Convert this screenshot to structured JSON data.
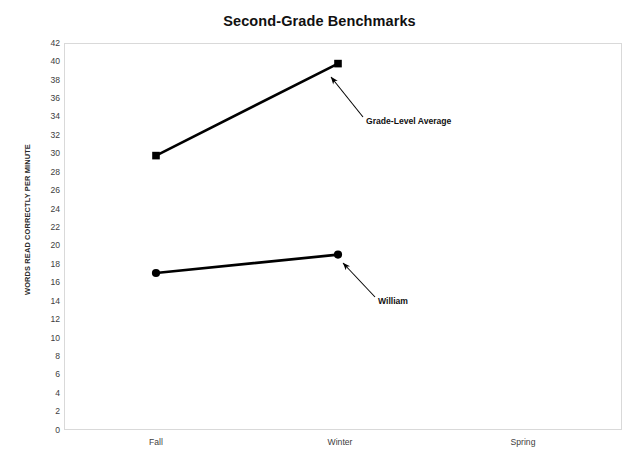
{
  "chart_data": {
    "type": "line",
    "title": "Second-Grade Benchmarks",
    "xlabel": "",
    "ylabel": "WORDS READ CORRECTLY PER MINUTE",
    "categories": [
      "Fall",
      "Winter",
      "Spring"
    ],
    "ylim": [
      0,
      42
    ],
    "ytick_step": 2,
    "yticks": [
      42,
      40,
      38,
      36,
      34,
      32,
      30,
      28,
      26,
      24,
      22,
      20,
      18,
      16,
      14,
      12,
      10,
      8,
      6,
      4,
      2,
      0
    ],
    "grid": false,
    "legend": "none",
    "series": [
      {
        "name": "Grade-Level Average",
        "marker": "square",
        "color": "#000000",
        "values": [
          30,
          40,
          null
        ]
      },
      {
        "name": "William",
        "marker": "circle",
        "color": "#000000",
        "values": [
          17,
          19,
          null
        ]
      }
    ],
    "annotations": [
      {
        "text": "Grade-Level Average",
        "points_to": "Grade-Level Average series at Winter (40)",
        "arrow": "up-left"
      },
      {
        "text": "William",
        "points_to": "William series at Winter (19)",
        "arrow": "up-left"
      }
    ]
  },
  "axis": {
    "y_title": "WORDS READ CORRECTLY PER MINUTE",
    "y_labels": [
      "42",
      "40",
      "38",
      "36",
      "34",
      "32",
      "30",
      "28",
      "26",
      "24",
      "22",
      "20",
      "18",
      "16",
      "14",
      "12",
      "10",
      "8",
      "6",
      "4",
      "2",
      "0"
    ],
    "x_labels": [
      "Fall",
      "Winter",
      "Spring"
    ]
  },
  "annotations": {
    "grade_level_average": "Grade-Level Average",
    "william": "William"
  },
  "colors": {
    "series": "#000000",
    "plot_border": "#d9d9d9",
    "tick_text": "#404040",
    "title_text": "#111111",
    "background": "#ffffff"
  }
}
